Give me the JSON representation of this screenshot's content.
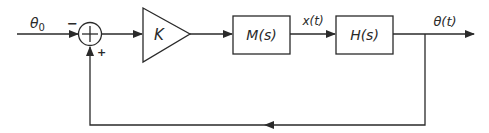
{
  "diagram": {
    "type": "control-system-block-diagram",
    "input_label": "θ₀",
    "input_label_main": "θ",
    "input_label_sub": "0",
    "summing_junction": {
      "input_sign": "−",
      "feedback_sign": "+"
    },
    "gain_block": {
      "label": "K"
    },
    "block_1": {
      "label": "M(s)"
    },
    "intermediate_signal": "x(t)",
    "block_2": {
      "label": "H(s)"
    },
    "output_label": "θ(t)",
    "colors": {
      "line": "#2a2a2a",
      "background": "#ffffff"
    }
  }
}
